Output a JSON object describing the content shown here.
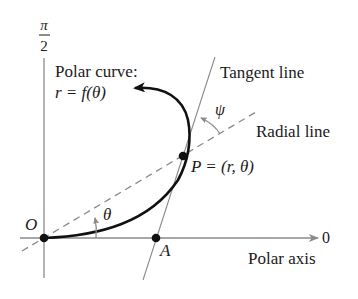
{
  "diagram": {
    "labels": {
      "pi": "π",
      "two": "2",
      "polar_curve_line1": "Polar curve:",
      "polar_curve_line2": "r = f(θ)",
      "tangent_line": "Tangent line",
      "radial_line": "Radial line",
      "psi": "ψ",
      "point_p": "P = (r, θ)",
      "origin": "O",
      "theta": "θ",
      "point_a": "A",
      "zero": "0",
      "polar_axis": "Polar axis"
    },
    "colors": {
      "axis": "#8a8a8a",
      "curve": "#111111",
      "tangent": "#8a8a8a",
      "radial_dashed": "#8a8a8a",
      "points": "#111111",
      "text": "#1a1a1a"
    },
    "points": {
      "O": [
        44,
        238
      ],
      "P": [
        183,
        156
      ],
      "A": [
        156,
        238
      ]
    }
  }
}
